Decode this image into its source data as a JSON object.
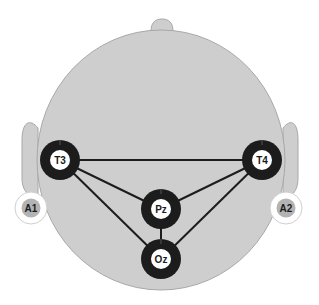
{
  "diagram": {
    "colors": {
      "head_fill": "#cecece",
      "head_stroke": "#a8a8a8",
      "electrode_ring": "#1c1c1c",
      "electrode_center": "#ffffff",
      "reference_ring": "#ffffff",
      "reference_center": "#b3b3b3",
      "connection_line": "#1c1c1c"
    },
    "electrodes": [
      {
        "id": "T3",
        "label": "T3",
        "x": 60,
        "y": 160,
        "type": "active"
      },
      {
        "id": "T4",
        "label": "T4",
        "x": 262,
        "y": 160,
        "type": "active"
      },
      {
        "id": "Pz",
        "label": "Pz",
        "x": 161,
        "y": 209,
        "type": "active"
      },
      {
        "id": "Oz",
        "label": "Oz",
        "x": 161,
        "y": 259,
        "type": "active"
      }
    ],
    "references": [
      {
        "id": "A1",
        "label": "A1",
        "x": 31,
        "y": 208
      },
      {
        "id": "A2",
        "label": "A2",
        "x": 286,
        "y": 208
      }
    ],
    "connections": [
      [
        "T3",
        "T4"
      ],
      [
        "T3",
        "Pz"
      ],
      [
        "T3",
        "Oz"
      ],
      [
        "T4",
        "Pz"
      ],
      [
        "T4",
        "Oz"
      ],
      [
        "Pz",
        "Oz"
      ]
    ]
  }
}
